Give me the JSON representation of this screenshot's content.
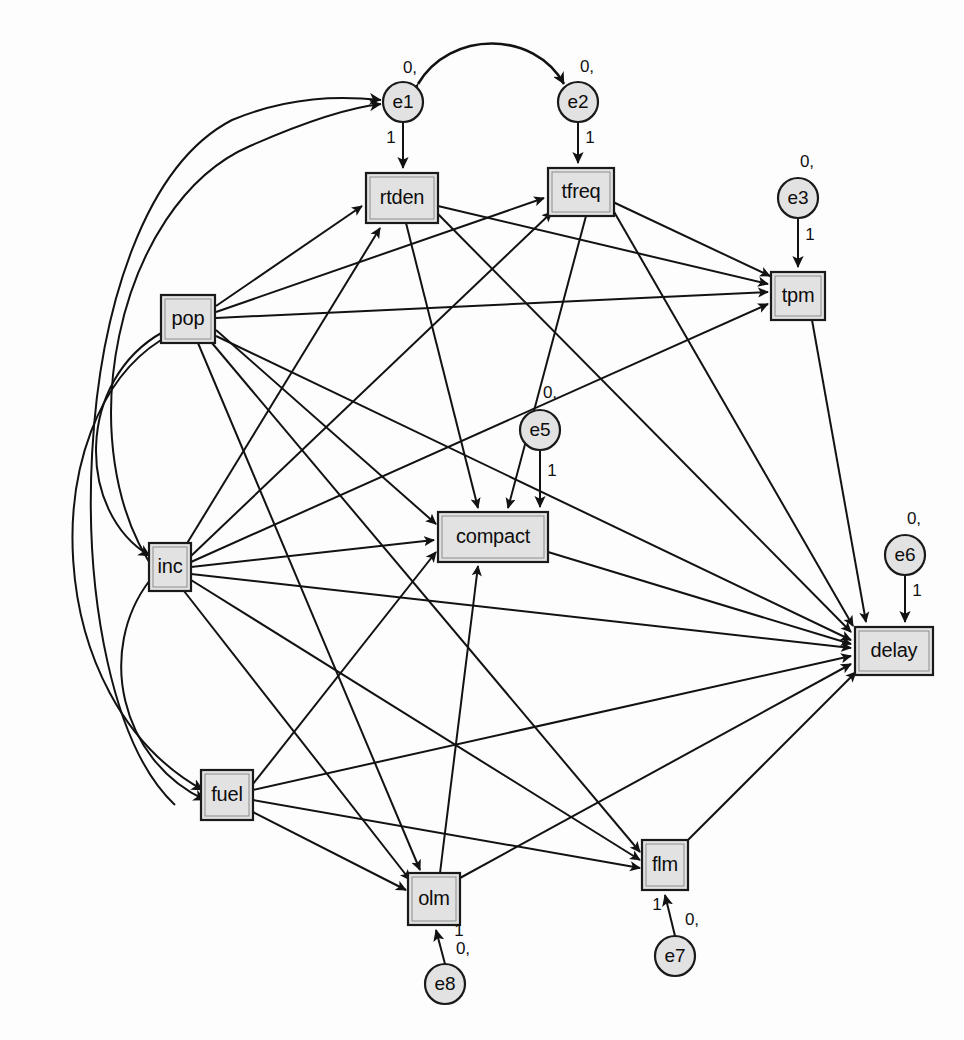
{
  "diagram": {
    "type": "sem-path-diagram",
    "caption": "",
    "colors": {
      "node_fill": "#e2e2e2",
      "node_stroke": "#1a1a1a",
      "edge_stroke": "#121212",
      "background": "#ffffff"
    },
    "observed_variables": [
      {
        "id": "rtden",
        "label": "rtden",
        "x": 402,
        "y": 198,
        "w": 72,
        "h": 50
      },
      {
        "id": "tfreq",
        "label": "tfreq",
        "x": 581,
        "y": 192,
        "w": 66,
        "h": 48
      },
      {
        "id": "tpm",
        "label": "tpm",
        "x": 798,
        "y": 296,
        "w": 54,
        "h": 48
      },
      {
        "id": "pop",
        "label": "pop",
        "x": 188,
        "y": 319,
        "w": 54,
        "h": 48
      },
      {
        "id": "compact",
        "label": "compact",
        "x": 493,
        "y": 537,
        "w": 110,
        "h": 50
      },
      {
        "id": "inc",
        "label": "inc",
        "x": 170,
        "y": 567,
        "w": 42,
        "h": 48
      },
      {
        "id": "delay",
        "label": "delay",
        "x": 894,
        "y": 651,
        "w": 78,
        "h": 48
      },
      {
        "id": "fuel",
        "label": "fuel",
        "x": 227,
        "y": 795,
        "w": 52,
        "h": 50
      },
      {
        "id": "flm",
        "label": "flm",
        "x": 665,
        "y": 865,
        "w": 46,
        "h": 50
      },
      {
        "id": "olm",
        "label": "olm",
        "x": 434,
        "y": 899,
        "w": 52,
        "h": 52
      }
    ],
    "error_terms": [
      {
        "id": "e1",
        "label": "e1",
        "cx": 403,
        "cy": 102,
        "r": 20,
        "mean_label": "0,",
        "mean_x": 410,
        "mean_y": 69,
        "loading": "1",
        "loading_x": 391,
        "loading_y": 139,
        "target": "rtden"
      },
      {
        "id": "e2",
        "label": "e2",
        "cx": 578,
        "cy": 102,
        "r": 20,
        "mean_label": "0,",
        "mean_x": 587,
        "mean_y": 68,
        "loading": "1",
        "loading_x": 590,
        "loading_y": 139,
        "target": "tfreq"
      },
      {
        "id": "e3",
        "label": "e3",
        "cx": 798,
        "cy": 198,
        "r": 20,
        "mean_label": "0,",
        "mean_x": 807,
        "mean_y": 163,
        "loading": "1",
        "loading_x": 810,
        "loading_y": 236,
        "target": "tpm"
      },
      {
        "id": "e5",
        "label": "e5",
        "cx": 540,
        "cy": 430,
        "r": 20,
        "mean_label": "0,",
        "mean_x": 550,
        "mean_y": 394,
        "loading": "1",
        "loading_x": 552,
        "loading_y": 472,
        "target": "compact"
      },
      {
        "id": "e6",
        "label": "e6",
        "cx": 905,
        "cy": 555,
        "r": 20,
        "mean_label": "0,",
        "mean_x": 914,
        "mean_y": 520,
        "loading": "1",
        "loading_x": 917,
        "loading_y": 592,
        "target": "delay"
      },
      {
        "id": "e7",
        "label": "e7",
        "cx": 675,
        "cy": 956,
        "r": 20,
        "mean_label": "0,",
        "mean_x": 692,
        "mean_y": 921,
        "loading": "1",
        "loading_x": 657,
        "loading_y": 906,
        "target": "flm"
      },
      {
        "id": "e8",
        "label": "e8",
        "cx": 445,
        "cy": 984,
        "r": 20,
        "mean_label": "0,",
        "mean_x": 463,
        "mean_y": 950,
        "loading": "1",
        "loading_x": 459,
        "loading_y": 932,
        "target": "olm"
      }
    ],
    "directed_paths": [
      {
        "from": "pop",
        "to": "rtden"
      },
      {
        "from": "pop",
        "to": "tfreq"
      },
      {
        "from": "pop",
        "to": "tpm"
      },
      {
        "from": "pop",
        "to": "compact"
      },
      {
        "from": "pop",
        "to": "delay"
      },
      {
        "from": "pop",
        "to": "olm"
      },
      {
        "from": "pop",
        "to": "flm"
      },
      {
        "from": "inc",
        "to": "rtden"
      },
      {
        "from": "inc",
        "to": "tfreq"
      },
      {
        "from": "inc",
        "to": "tpm"
      },
      {
        "from": "inc",
        "to": "compact"
      },
      {
        "from": "inc",
        "to": "delay"
      },
      {
        "from": "inc",
        "to": "olm"
      },
      {
        "from": "inc",
        "to": "flm"
      },
      {
        "from": "fuel",
        "to": "compact"
      },
      {
        "from": "fuel",
        "to": "delay"
      },
      {
        "from": "fuel",
        "to": "olm"
      },
      {
        "from": "fuel",
        "to": "flm"
      },
      {
        "from": "rtden",
        "to": "tpm"
      },
      {
        "from": "rtden",
        "to": "compact"
      },
      {
        "from": "rtden",
        "to": "delay"
      },
      {
        "from": "tfreq",
        "to": "tpm"
      },
      {
        "from": "tfreq",
        "to": "compact"
      },
      {
        "from": "tfreq",
        "to": "delay"
      },
      {
        "from": "tpm",
        "to": "delay"
      },
      {
        "from": "compact",
        "to": "delay"
      },
      {
        "from": "olm",
        "to": "compact"
      },
      {
        "from": "olm",
        "to": "delay"
      },
      {
        "from": "flm",
        "to": "delay"
      }
    ],
    "covariances": [
      {
        "between": [
          "e1",
          "e2"
        ],
        "style": "curved-double-arrow"
      },
      {
        "between": [
          "pop",
          "inc"
        ],
        "style": "curved-double-arrow"
      },
      {
        "between": [
          "pop",
          "fuel"
        ],
        "style": "curved-double-arrow"
      },
      {
        "between": [
          "inc",
          "fuel"
        ],
        "style": "curved-double-arrow"
      }
    ],
    "exogenous_inputs_to_e1": [
      {
        "from": "pop-region",
        "to": "e1"
      }
    ]
  }
}
